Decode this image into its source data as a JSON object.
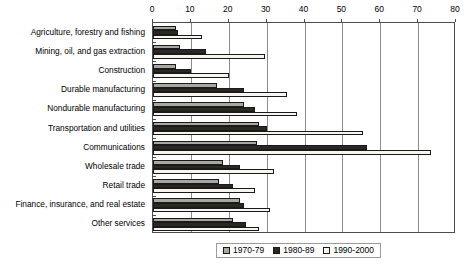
{
  "chart_data": {
    "type": "bar",
    "orientation": "horizontal",
    "title": "",
    "subtitle": "",
    "xlabel": "",
    "ylabel": "",
    "xlim": [
      0,
      80
    ],
    "xticks": [
      0,
      10,
      20,
      30,
      40,
      50,
      60,
      70,
      80
    ],
    "xtick_labels": [
      "0",
      "10",
      "20",
      "30",
      "40",
      "50",
      "60",
      "70",
      "80"
    ],
    "grid": "vertical",
    "legend_position": "bottom-center",
    "categories": [
      "Agriculture, forestry and fishing",
      "Mining, oil, and gas extraction",
      "Construction",
      "Durable manufacturing",
      "Nondurable manufacturing",
      "Transportation and utilities",
      "Communications",
      "Wholesale trade",
      "Retail trade",
      "Finance, insurance, and real estate",
      "Other services"
    ],
    "series": [
      {
        "name": "1970-79",
        "color": "#a8a8a0",
        "values": [
          6.0,
          7.0,
          6.0,
          17.0,
          24.0,
          28.0,
          27.5,
          18.5,
          17.5,
          23.0,
          21.0
        ]
      },
      {
        "name": "1980-89",
        "color": "#2b2722",
        "values": [
          6.5,
          14.0,
          10.0,
          24.0,
          27.0,
          30.0,
          56.5,
          23.0,
          21.0,
          24.0,
          24.5
        ]
      },
      {
        "name": "1990-2000",
        "color": "#f7f5ee",
        "values": [
          13.0,
          29.5,
          20.0,
          35.5,
          38.0,
          55.5,
          73.5,
          32.0,
          27.0,
          31.0,
          28.0
        ]
      }
    ]
  },
  "legend": {
    "entries": [
      {
        "label": "1970-79"
      },
      {
        "label": "1980-89"
      },
      {
        "label": "1990-2000"
      }
    ]
  }
}
